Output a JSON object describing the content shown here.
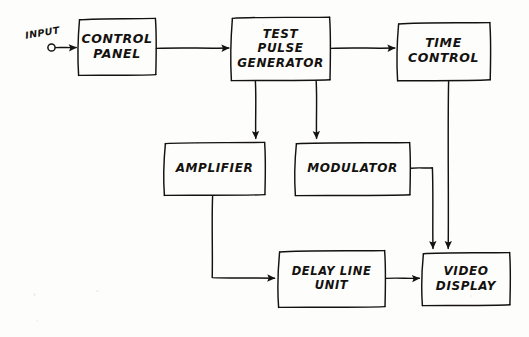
{
  "diagram": {
    "style": "hand-drawn pencil sketch",
    "ink_color": "#14120f",
    "paper_color": "#fdfdfc",
    "width": 529,
    "height": 337,
    "terminal": {
      "label": "INPUT",
      "type": "open-circle-terminal"
    },
    "blocks": [
      {
        "id": "control-panel",
        "lines": [
          "CONTROL",
          "PANEL"
        ],
        "line1": "CONTROL",
        "line2": "PANEL",
        "x": 78,
        "y": 18,
        "w": 78,
        "h": 57
      },
      {
        "id": "test-pulse-generator",
        "lines": [
          "TEST",
          "PULSE",
          "GENERATOR"
        ],
        "line1": "TEST",
        "line2": "PULSE",
        "line3": "GENERATOR",
        "x": 231,
        "y": 17,
        "w": 99,
        "h": 63
      },
      {
        "id": "time-control",
        "lines": [
          "TIME",
          "CONTROL"
        ],
        "line1": "TIME",
        "line2": "CONTROL",
        "x": 397,
        "y": 22,
        "w": 93,
        "h": 58
      },
      {
        "id": "amplifier",
        "lines": [
          "AMPLIFIER"
        ],
        "line1": "AMPLIFIER",
        "x": 164,
        "y": 142,
        "w": 101,
        "h": 53
      },
      {
        "id": "modulator",
        "lines": [
          "MODULATOR"
        ],
        "line1": "MODULATOR",
        "x": 295,
        "y": 142,
        "w": 115,
        "h": 53
      },
      {
        "id": "delay-line-unit",
        "lines": [
          "DELAY LINE",
          "UNIT"
        ],
        "line1": "DELAY LINE",
        "line2": "UNIT",
        "x": 278,
        "y": 250,
        "w": 107,
        "h": 57
      },
      {
        "id": "video-display",
        "lines": [
          "VIDEO",
          "DISPLAY"
        ],
        "line1": "VIDEO",
        "line2": "DISPLAY",
        "x": 422,
        "y": 252,
        "w": 88,
        "h": 53
      }
    ],
    "connections": [
      {
        "id": "input-to-control-panel",
        "from": "INPUT",
        "to": "CONTROL PANEL",
        "route": "horizontal"
      },
      {
        "id": "control-panel-to-tpg",
        "from": "CONTROL PANEL",
        "to": "TEST PULSE GENERATOR",
        "route": "horizontal"
      },
      {
        "id": "tpg-to-time-control",
        "from": "TEST PULSE GENERATOR",
        "to": "TIME CONTROL",
        "route": "horizontal"
      },
      {
        "id": "tpg-to-amplifier",
        "from": "TEST PULSE GENERATOR",
        "to": "AMPLIFIER",
        "route": "vertical"
      },
      {
        "id": "tpg-to-modulator",
        "from": "TEST PULSE GENERATOR",
        "to": "MODULATOR",
        "route": "vertical"
      },
      {
        "id": "amplifier-to-delay-line-unit",
        "from": "AMPLIFIER",
        "to": "DELAY LINE UNIT",
        "route": "down-then-right"
      },
      {
        "id": "delay-line-unit-to-video",
        "from": "DELAY LINE UNIT",
        "to": "VIDEO DISPLAY",
        "route": "horizontal"
      },
      {
        "id": "modulator-to-video",
        "from": "MODULATOR",
        "to": "VIDEO DISPLAY",
        "route": "right-then-down"
      },
      {
        "id": "time-control-to-video",
        "from": "TIME CONTROL",
        "to": "VIDEO DISPLAY",
        "route": "vertical"
      }
    ]
  }
}
